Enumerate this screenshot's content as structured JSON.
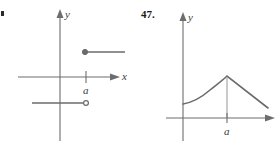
{
  "figures": [
    {
      "id": "left-figure",
      "exercise_number": "",
      "crop_artifact": ".",
      "axes": {
        "y_label": "y",
        "x_label": "x",
        "tick_label": "a",
        "x_axis_y": 77,
        "y_axis_x": 60,
        "tick_x": 86
      },
      "graph_type": "piecewise-step",
      "description": "Step function: lower horizontal ray ending with open circle at x=a, upper horizontal ray beginning with filled dot at x=a",
      "upper_ray": {
        "endpoint_type": "filled",
        "endpoint_x": 85,
        "endpoint_y": 52,
        "extends_to_x": 125
      },
      "lower_ray": {
        "endpoint_type": "open",
        "endpoint_x": 86,
        "endpoint_y": 103,
        "extends_to_x": 32
      },
      "color": "#6b6b6b"
    },
    {
      "id": "right-figure",
      "exercise_number": "47.",
      "crop_artifact": "",
      "axes": {
        "y_label": "y",
        "x_label": "",
        "tick_label": "a",
        "x_axis_y": 118,
        "y_axis_x": 183,
        "tick_x": 227
      },
      "graph_type": "cusp-peak-curve",
      "description": "Curve rising concave-up from the y-axis to a sharp cusp maximum at x=a, then descending in a straight line",
      "curve_points": [
        [
          183,
          104
        ],
        [
          196,
          99
        ],
        [
          208,
          91
        ],
        [
          218,
          84
        ],
        [
          227,
          76
        ],
        [
          245,
          90
        ],
        [
          268,
          108
        ]
      ],
      "peak": {
        "x": 227,
        "y": 76
      },
      "color": "#6b6b6b"
    }
  ],
  "page": {
    "background_color": "#ffffff",
    "line_color": "#6b6b6b",
    "axis_color": "#6d6d6d",
    "text_color": "#3b3b3b"
  }
}
